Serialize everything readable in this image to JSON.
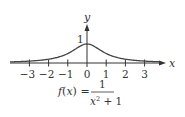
{
  "chart_data": {
    "type": "line",
    "title": "",
    "function_label": "f(x) = 1 / (x^2 + 1)",
    "formula": {
      "lhs": "f(x) =",
      "numerator": "1",
      "denominator_base": "x",
      "denominator_exp": "2",
      "denominator_rest": " + 1"
    },
    "xlabel": "x",
    "ylabel": "y",
    "xlim": [
      -4,
      4
    ],
    "ylim": [
      0,
      1.2
    ],
    "x_ticks": [
      -3,
      -2,
      -1,
      0,
      1,
      2,
      3
    ],
    "x_tick_labels": [
      "−3",
      "−2",
      "−1",
      "0",
      "1",
      "2",
      "3"
    ],
    "y_ticks": [
      1
    ],
    "y_tick_labels": [
      "1"
    ],
    "grid": false,
    "legend": "none",
    "series": [
      {
        "name": "f(x) = 1/(x^2+1)",
        "x": [
          -4,
          -3.5,
          -3,
          -2.5,
          -2,
          -1.5,
          -1,
          -0.5,
          0,
          0.5,
          1,
          1.5,
          2,
          2.5,
          3,
          3.5,
          4
        ],
        "values": [
          0.059,
          0.075,
          0.1,
          0.138,
          0.2,
          0.308,
          0.5,
          0.8,
          1.0,
          0.8,
          0.5,
          0.308,
          0.2,
          0.138,
          0.1,
          0.075,
          0.059
        ],
        "color": "#444444"
      }
    ]
  },
  "axes": {
    "x_label": "x",
    "y_label": "y",
    "y_tick_label": "1"
  }
}
